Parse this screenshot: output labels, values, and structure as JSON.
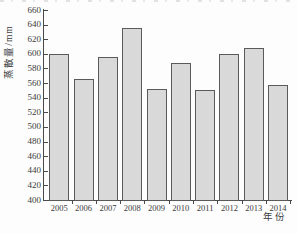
{
  "chart_data": {
    "type": "bar",
    "title": "",
    "categories": [
      "2005",
      "2006",
      "2007",
      "2008",
      "2009",
      "2010",
      "2011",
      "2012",
      "2013",
      "2014"
    ],
    "values": [
      600,
      565,
      596,
      635,
      552,
      588,
      551,
      600,
      608,
      558
    ],
    "xlabel": "年份",
    "ylabel": "蒸散量/mm",
    "ylim": [
      400,
      660
    ],
    "ytick_step": 20,
    "grid": false,
    "legend_position": "none",
    "colors": {
      "bar_fill": "#d9d9d9",
      "bar_border": "#5a5a5a",
      "axis": "#4a4a4a",
      "text": "#3c3c3c",
      "background": "#fdfdfd"
    }
  }
}
